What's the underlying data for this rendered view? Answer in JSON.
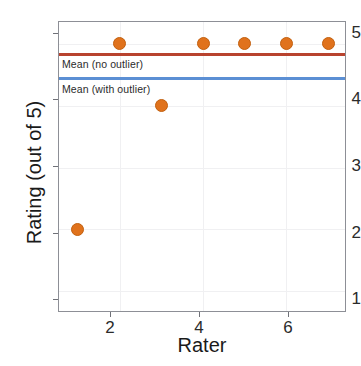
{
  "chart_data": {
    "type": "scatter",
    "title": "",
    "xlabel": "Rater",
    "ylabel": "Rating (out of 5)",
    "x": [
      1,
      2,
      3,
      4,
      5,
      6,
      7
    ],
    "values": [
      2,
      5,
      4,
      5,
      5,
      5,
      5
    ],
    "series": [
      {
        "name": "Ratings",
        "x": [
          1,
          2,
          3,
          4,
          5,
          6,
          7
        ],
        "values": [
          2,
          5,
          4,
          5,
          5,
          5,
          5
        ],
        "marker_color": "#e0721c"
      }
    ],
    "xlim": [
      0.55,
      7.45
    ],
    "ylim": [
      0.65,
      5.35
    ],
    "xticks": [
      2,
      4,
      6
    ],
    "yticks": [
      1,
      2,
      3,
      4,
      5
    ],
    "xtick_labels": [
      "2",
      "4",
      "6"
    ],
    "ytick_labels": [
      "1",
      "2",
      "3",
      "4",
      "5"
    ],
    "grid": true,
    "legend": "none",
    "annotations": [
      {
        "label": "Mean (no outlier)",
        "value": 4.83,
        "color": "#b8432f",
        "type": "hline"
      },
      {
        "label": "Mean (with outlier)",
        "value": 4.43,
        "color": "#5b8fd4",
        "type": "hline"
      }
    ]
  },
  "colors": {
    "marker": "#e0721c",
    "marker_edge": "#c2600f",
    "mean_no_outlier": "#b8432f",
    "mean_with_outlier": "#5b8fd4",
    "panel_border": "#8d8f96",
    "gridline": "#f0f0f2",
    "text": "#1a1a1a",
    "background": "#ffffff"
  }
}
